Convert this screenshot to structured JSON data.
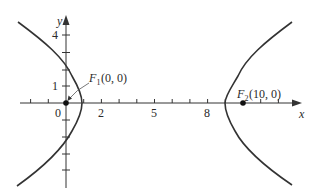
{
  "figure": {
    "type": "hyperbola-diagram",
    "axes": {
      "x_label": "x",
      "y_label": "y",
      "x_tick_labels": [
        "0",
        "2",
        "5",
        "8"
      ],
      "y_tick_labels": [
        "1",
        "4"
      ]
    },
    "foci": [
      {
        "name": "F1",
        "label_main": "F",
        "label_sub": "1",
        "label_coords": "(0, 0)",
        "x": 0,
        "y": 0
      },
      {
        "name": "F2",
        "label_main": "F",
        "label_sub": "2",
        "label_coords": "(10, 0)",
        "x": 10,
        "y": 0
      }
    ],
    "colors": {
      "curve": "#333333",
      "axis": "#333333",
      "background": "#ffffff"
    }
  }
}
